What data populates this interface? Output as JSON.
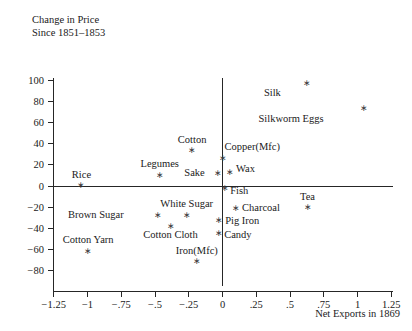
{
  "chart_data": {
    "type": "scatter",
    "title": "",
    "title_lines": [
      "Change in Price",
      "Since 1851–1853"
    ],
    "xlabel": "Net Exports in 1869",
    "ylabel": "Change in Price Since 1851–1853",
    "xlim": [
      -1.375,
      1.375
    ],
    "ylim": [
      -88,
      108
    ],
    "xticks": [
      -1.25,
      -1,
      -0.75,
      -0.5,
      -0.25,
      0,
      0.25,
      0.5,
      0.75,
      1,
      1.25
    ],
    "xticklabels": [
      "−1.25",
      "−1",
      "−.75",
      "−.5",
      "−.25",
      "0",
      ".25",
      ".5",
      ".75",
      "1",
      "1.25"
    ],
    "yticks": [
      -80,
      -60,
      -40,
      -20,
      0,
      20,
      40,
      60,
      80,
      100
    ],
    "yticklabels": [
      "−80",
      "−60",
      "−40",
      "−20",
      "0",
      "20",
      "40",
      "60",
      "80",
      "100"
    ],
    "grid": false,
    "legend": null,
    "zero_lines": {
      "vertical_x": 0,
      "horizontal_y": 0
    },
    "points": [
      {
        "label": "Silk",
        "x": 0.625,
        "y": 97,
        "label_dx": -26,
        "label_dy": 13
      },
      {
        "label": "Silkworm Eggs",
        "x": 1.045,
        "y": 74,
        "label_dx": -40,
        "label_dy": 14
      },
      {
        "label": "Cotton",
        "x": -0.225,
        "y": 34,
        "label_dx": 0,
        "label_dy": -7
      },
      {
        "label": "Copper(Mfc)",
        "x": 0.0,
        "y": 27,
        "label_dx": 2,
        "label_dy": -7
      },
      {
        "label": "Legumes",
        "x": -0.465,
        "y": 11,
        "label_dx": 0,
        "label_dy": -7
      },
      {
        "label": "Sake",
        "x": -0.035,
        "y": 12,
        "label_dx": -13,
        "label_dy": 3
      },
      {
        "label": "Wax",
        "x": 0.055,
        "y": 13,
        "label_dx": 6,
        "label_dy": 0
      },
      {
        "label": "Rice",
        "x": -1.045,
        "y": 1,
        "label_dx": 0,
        "label_dy": -7
      },
      {
        "label": "Fish",
        "x": 0.02,
        "y": -2,
        "label_dx": 5,
        "label_dy": 6
      },
      {
        "label": "Charcoal",
        "x": 0.1,
        "y": -21,
        "label_dx": 6,
        "label_dy": 3
      },
      {
        "label": "Tea",
        "x": 0.63,
        "y": -20,
        "label_dx": 0,
        "label_dy": -7
      },
      {
        "label": "White Sugar",
        "x": -0.265,
        "y": -27,
        "label_dx": 0,
        "label_dy": -8
      },
      {
        "label": "Brown Sugar",
        "x": -0.48,
        "y": -27,
        "label_dx": -34,
        "label_dy": 3
      },
      {
        "label": "Pig Iron",
        "x": -0.025,
        "y": -32,
        "label_dx": 6,
        "label_dy": 4
      },
      {
        "label": "Cotton Cloth",
        "x": -0.385,
        "y": -38,
        "label_dx": 0,
        "label_dy": 12
      },
      {
        "label": "Candy",
        "x": -0.025,
        "y": -44,
        "label_dx": 5,
        "label_dy": 5
      },
      {
        "label": "Cotton Yarn",
        "x": -0.995,
        "y": -61,
        "label_dx": 0,
        "label_dy": -8
      },
      {
        "label": "Iron(Mfc)",
        "x": -0.19,
        "y": -71,
        "label_dx": 0,
        "label_dy": -7
      }
    ]
  }
}
